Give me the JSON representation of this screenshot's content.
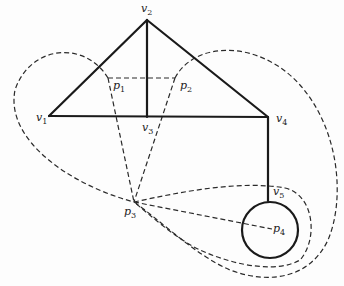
{
  "diagram": {
    "colors": {
      "stroke": "#1a1a1a",
      "dashed": "#2a2a2a",
      "background": "#fdfdfd"
    },
    "vertices": [
      {
        "id": "v1",
        "name": "v",
        "sub": "1",
        "x": 49,
        "y": 116,
        "lx": 36,
        "ly": 112
      },
      {
        "id": "v2",
        "name": "v",
        "sub": "2",
        "x": 147,
        "y": 20,
        "lx": 141,
        "ly": 3
      },
      {
        "id": "v3",
        "name": "v",
        "sub": "3",
        "x": 147,
        "y": 117,
        "lx": 142,
        "ly": 122
      },
      {
        "id": "v4",
        "name": "v",
        "sub": "4",
        "x": 268,
        "y": 117,
        "lx": 276,
        "ly": 113
      },
      {
        "id": "v5",
        "name": "v",
        "sub": "5",
        "x": 268,
        "y": 201,
        "lx": 273,
        "ly": 186
      }
    ],
    "points": [
      {
        "id": "p1",
        "name": "p",
        "sub": "1",
        "x": 108,
        "y": 78,
        "lx": 113,
        "ly": 80
      },
      {
        "id": "p2",
        "name": "p",
        "sub": "2",
        "x": 175,
        "y": 78,
        "lx": 180,
        "ly": 80
      },
      {
        "id": "p3",
        "name": "p",
        "sub": "3",
        "x": 134,
        "y": 202,
        "lx": 124,
        "ly": 206
      },
      {
        "id": "p4",
        "name": "p",
        "sub": "4",
        "x": 272,
        "y": 229,
        "lx": 273,
        "ly": 223
      }
    ],
    "solid_edges": [
      {
        "from": "v1",
        "to": "v2"
      },
      {
        "from": "v2",
        "to": "v4"
      },
      {
        "from": "v1",
        "to": "v4"
      },
      {
        "from": "v2",
        "to": "v3"
      },
      {
        "from": "v4",
        "to": "v5"
      }
    ],
    "loop": {
      "cx": 270,
      "cy": 230,
      "r": 28
    },
    "dashed_paths": [
      "M108,78 L175,78",
      "M108,78 L134,202",
      "M175,78 L134,202",
      "M134,202 L272,229",
      "M108,78 C85,40 30,45 15,90 C5,140 70,185 134,202",
      "M175,78 C195,40 260,40 300,85 C340,130 345,200 328,240 C310,278 270,285 230,270 C195,255 160,220 134,202",
      "M134,202 C180,192 240,180 285,188 C315,195 318,240 300,260 C280,272 240,268 200,250 C175,238 150,215 134,202"
    ]
  }
}
